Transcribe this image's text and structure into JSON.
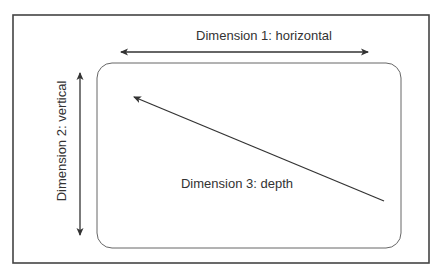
{
  "diagram": {
    "labels": {
      "dimension1": "Dimension 1: horizontal",
      "dimension2": "Dimension 2: vertical",
      "dimension3": "Dimension 3: depth"
    },
    "colors": {
      "frame": "#444444",
      "panel": "#666666",
      "arrow": "#333333",
      "text": "#333333",
      "background": "#ffffff"
    }
  }
}
